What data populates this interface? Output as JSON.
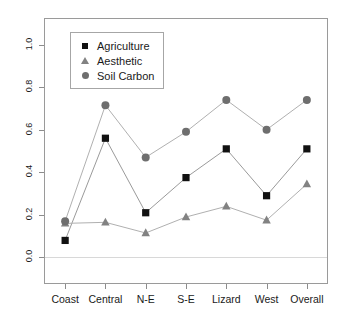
{
  "chart_data": {
    "type": "line",
    "title": "",
    "subtitle": "",
    "xlabel": "",
    "ylabel": "Moran's I",
    "categories": [
      "Coast",
      "Central",
      "N-E",
      "S-E",
      "Lizard",
      "West",
      "Overall"
    ],
    "ylim": [
      -0.12,
      1.12
    ],
    "yticks": [
      0.0,
      0.2,
      0.4,
      0.6,
      0.8,
      1.0
    ],
    "ytick_labels": [
      "0.0",
      "0.2",
      "0.4",
      "0.6",
      "0.8",
      "1.0"
    ],
    "grid": false,
    "zero_reference_line": 0.0,
    "legend_position": "top-left",
    "series": [
      {
        "name": "Agriculture",
        "marker": "square",
        "color": "#111111",
        "line_color": "#9a9a9a",
        "values": [
          0.08,
          0.56,
          0.21,
          0.375,
          0.51,
          0.29,
          0.51
        ]
      },
      {
        "name": "Aesthetic",
        "marker": "triangle",
        "color": "#828282",
        "line_color": "#b0b0b0",
        "values": [
          0.16,
          0.165,
          0.115,
          0.19,
          0.24,
          0.175,
          0.345
        ]
      },
      {
        "name": "Soil Carbon",
        "marker": "circle",
        "color": "#6e6e6e",
        "line_color": "#b0b0b0",
        "values": [
          0.17,
          0.715,
          0.47,
          0.59,
          0.74,
          0.6,
          0.74
        ]
      }
    ]
  },
  "legend": {
    "entries": [
      {
        "label": "Agriculture",
        "icon": "square-marker-icon"
      },
      {
        "label": "Aesthetic",
        "icon": "triangle-marker-icon"
      },
      {
        "label": "Soil Carbon",
        "icon": "circle-marker-icon"
      }
    ]
  },
  "axes": {
    "y_title": "Moran's I",
    "y_tick_labels": [
      "0.0",
      "0.2",
      "0.4",
      "0.6",
      "0.8",
      "1.0"
    ],
    "x_tick_labels": [
      "Coast",
      "Central",
      "N-E",
      "S-E",
      "Lizard",
      "West",
      "Overall"
    ]
  },
  "colors": {
    "agriculture": "#111111",
    "aesthetic": "#828282",
    "soil_carbon": "#6e6e6e",
    "frame": "#9a9a9a",
    "connector": "#b0b0b0",
    "zero_line": "#d8d8d8",
    "background": "#ffffff"
  }
}
